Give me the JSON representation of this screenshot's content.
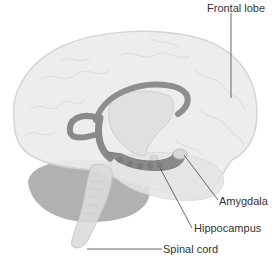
{
  "diagram": {
    "title": "",
    "labels": {
      "frontal_lobe": "Frontal lobe",
      "amygdala": "Amygdala",
      "hippocampus": "Hippocampus",
      "spinal_cord": "Spinal cord"
    },
    "colors": {
      "brain_fill": "#ececec",
      "brain_outline": "#d2d2d2",
      "limbic_fill": "#8c8c8c",
      "cerebellum_fill": "#a6a6a6",
      "leader_line": "#444444",
      "label_text": "#333333"
    }
  }
}
